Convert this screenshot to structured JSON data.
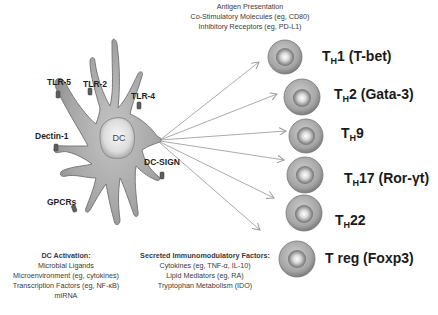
{
  "dc_outputs": {
    "lines": [
      "Antigen Presentation",
      "Co-Stimulatory Molecules (eg, CD80)",
      "Inhibitory Receptors (eg, PD-L1)"
    ]
  },
  "dendritic_cell": {
    "nucleus_label": "DC",
    "receptors": [
      {
        "label": "TLR-5"
      },
      {
        "label": "TLR-2"
      },
      {
        "label": "TLR-4"
      },
      {
        "label": "Dectin-1"
      },
      {
        "label": "DC-SIGN"
      },
      {
        "label": "GPCRs"
      }
    ]
  },
  "t_cells": [
    {
      "prefix": "T",
      "sub": "H",
      "suffix": "1 (T-bet)"
    },
    {
      "prefix": "T",
      "sub": "H",
      "suffix": "2 (Gata-3)"
    },
    {
      "prefix": "T",
      "sub": "H",
      "suffix": "9"
    },
    {
      "prefix": "T",
      "sub": "H",
      "suffix": "17 (Ror-γt)"
    },
    {
      "prefix": "T",
      "sub": "H",
      "suffix": "22"
    },
    {
      "prefix": "T reg (Foxp3)",
      "sub": "",
      "suffix": ""
    }
  ],
  "dc_activation": {
    "title": "DC Activation:",
    "lines": [
      "Microbial Ligands",
      "Microenvironment (eg, cytokines)",
      "Transcription Factors (eg, NF-κB)",
      "miRNA"
    ]
  },
  "secreted_factors": {
    "title": "Secreted Immunomodulatory Factors:",
    "lines": [
      "Cytokines (eg, TNF-α, IL-10)",
      "Lipid Mediators (eg, RA)",
      "Tryptophan Metabolism (IDO)"
    ]
  },
  "colors": {
    "cell_body": "#a9a9a9",
    "cell_outline": "#6e6e6e",
    "arrow": "#9a9a9a",
    "receptor": "#5a5a5a"
  }
}
